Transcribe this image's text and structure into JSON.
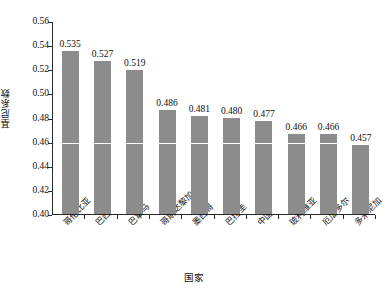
{
  "chart_data": {
    "type": "bar",
    "title": "",
    "xlabel": "国家",
    "ylabel": "基尼系数",
    "ylim": [
      0.4,
      0.56
    ],
    "ytick_step": 0.02,
    "yticks": [
      "0.56",
      "0.54",
      "0.52",
      "0.50",
      "0.48",
      "0.46",
      "0.44",
      "0.42",
      "0.40"
    ],
    "ytick_values": [
      0.56,
      0.54,
      0.52,
      0.5,
      0.48,
      0.46,
      0.44,
      0.42,
      0.4
    ],
    "grid": false,
    "gridline_highlight": 0.46,
    "legend": "none",
    "bar_color": "#8c8c8c",
    "categories": [
      "哥伦比亚",
      "巴西",
      "巴拿马",
      "哥斯达黎加",
      "墨西哥",
      "巴拉圭",
      "中国",
      "玻利维亚",
      "厄瓜多尔",
      "多米尼加"
    ],
    "values": [
      0.535,
      0.527,
      0.519,
      0.486,
      0.481,
      0.48,
      0.477,
      0.466,
      0.466,
      0.457
    ],
    "value_labels": [
      "0.535",
      "0.527",
      "0.519",
      "0.486",
      "0.481",
      "0.480",
      "0.477",
      "0.466",
      "0.466",
      "0.457"
    ]
  }
}
